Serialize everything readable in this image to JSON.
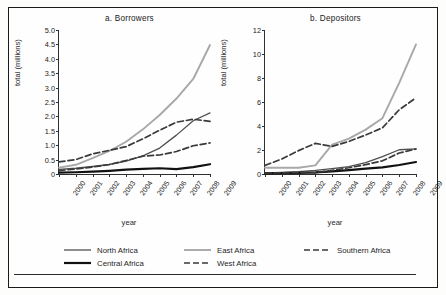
{
  "figure": {
    "background": "#fdfdfc",
    "border_color": "#1a1a1a"
  },
  "series_styles": {
    "north_africa": {
      "color": "#4f4f4f",
      "width": 1.3,
      "dash": "none"
    },
    "central_africa": {
      "color": "#111111",
      "width": 2.2,
      "dash": "none"
    },
    "east_africa": {
      "color": "#a8a8a8",
      "width": 1.9,
      "dash": "none"
    },
    "west_africa": {
      "color": "#3a3a3a",
      "width": 1.7,
      "dash": "6,3"
    },
    "southern_africa": {
      "color": "#3a3a3a",
      "width": 1.7,
      "dash": "6,3"
    }
  },
  "legend": {
    "items": [
      {
        "key": "north_africa",
        "label": "North Africa",
        "col": 0,
        "row": 0
      },
      {
        "key": "central_africa",
        "label": "Central Africa",
        "col": 0,
        "row": 1
      },
      {
        "key": "east_africa",
        "label": "East Africa",
        "col": 1,
        "row": 0
      },
      {
        "key": "west_africa",
        "label": "West Africa",
        "col": 1,
        "row": 1
      },
      {
        "key": "southern_africa",
        "label": "Southern Africa",
        "col": 2,
        "row": 0
      }
    ]
  },
  "chart_data": [
    {
      "type": "line",
      "id": "a",
      "title": "a.  Borrowers",
      "xlabel": "year",
      "ylabel": "total (millions)",
      "x": [
        2000,
        2001,
        2002,
        2003,
        2004,
        2005,
        2006,
        2007,
        2008,
        2009
      ],
      "xtick_labels": [
        "2000",
        "2001",
        "2002",
        "2003",
        "2004",
        "2005",
        "2006",
        "2007",
        "2008",
        "2009"
      ],
      "ylim": [
        0,
        5.0
      ],
      "ytick_values": [
        0,
        0.5,
        1.0,
        1.5,
        2.0,
        2.5,
        3.0,
        3.5,
        4.0,
        4.5,
        5.0
      ],
      "ytick_labels": [
        "0",
        "0.5",
        "1.0",
        "1.5",
        "2.0",
        "2.5",
        "3.0",
        "3.5",
        "4.0",
        "4.5",
        "5.0"
      ],
      "grid": false,
      "legend_position": "below-figure",
      "series": [
        {
          "name": "North Africa",
          "key": "north_africa",
          "values": [
            0.16,
            0.2,
            0.26,
            0.33,
            0.45,
            0.63,
            0.9,
            1.35,
            1.85,
            2.12
          ]
        },
        {
          "name": "Central Africa",
          "key": "central_africa",
          "values": [
            0.05,
            0.06,
            0.08,
            0.11,
            0.15,
            0.18,
            0.2,
            0.17,
            0.24,
            0.34
          ]
        },
        {
          "name": "East Africa",
          "key": "east_africa",
          "values": [
            0.22,
            0.32,
            0.55,
            0.8,
            1.12,
            1.55,
            2.05,
            2.62,
            3.3,
            4.48
          ]
        },
        {
          "name": "West Africa",
          "key": "west_africa",
          "values": [
            0.12,
            0.17,
            0.24,
            0.33,
            0.47,
            0.62,
            0.66,
            0.78,
            0.98,
            1.08
          ]
        },
        {
          "name": "Southern Africa",
          "key": "southern_africa",
          "values": [
            0.42,
            0.5,
            0.7,
            0.82,
            0.95,
            1.22,
            1.52,
            1.8,
            1.9,
            1.83
          ]
        }
      ]
    },
    {
      "type": "line",
      "id": "b",
      "title": "b.  Depositors",
      "xlabel": "year",
      "ylabel": "total (millions)",
      "x": [
        2000,
        2001,
        2002,
        2003,
        2004,
        2005,
        2006,
        2007,
        2008,
        2009
      ],
      "xtick_labels": [
        "2000",
        "2001",
        "2002",
        "2003",
        "2004",
        "2005",
        "2006",
        "2007",
        "2008",
        "2009"
      ],
      "ylim": [
        0,
        12
      ],
      "ytick_values": [
        0,
        2,
        4,
        6,
        8,
        10,
        12
      ],
      "ytick_labels": [
        "0",
        "2",
        "4",
        "6",
        "8",
        "10",
        "12"
      ],
      "grid": false,
      "legend_position": "below-figure",
      "series": [
        {
          "name": "North Africa",
          "key": "north_africa",
          "values": [
            0.1,
            0.14,
            0.2,
            0.3,
            0.45,
            0.62,
            0.95,
            1.45,
            2.02,
            2.1
          ]
        },
        {
          "name": "Central Africa",
          "key": "central_africa",
          "values": [
            0.06,
            0.08,
            0.1,
            0.14,
            0.22,
            0.32,
            0.44,
            0.55,
            0.75,
            1.0
          ]
        },
        {
          "name": "East Africa",
          "key": "east_africa",
          "values": [
            0.52,
            0.52,
            0.52,
            0.72,
            2.45,
            2.95,
            3.7,
            4.65,
            7.6,
            10.8
          ]
        },
        {
          "name": "West Africa",
          "key": "west_africa",
          "values": [
            0.08,
            0.1,
            0.12,
            0.1,
            0.3,
            0.52,
            0.78,
            1.1,
            1.75,
            2.08
          ]
        },
        {
          "name": "Southern Africa",
          "key": "southern_africa",
          "values": [
            0.72,
            1.25,
            1.95,
            2.55,
            2.3,
            2.72,
            3.25,
            3.85,
            5.35,
            6.35
          ]
        }
      ]
    }
  ]
}
